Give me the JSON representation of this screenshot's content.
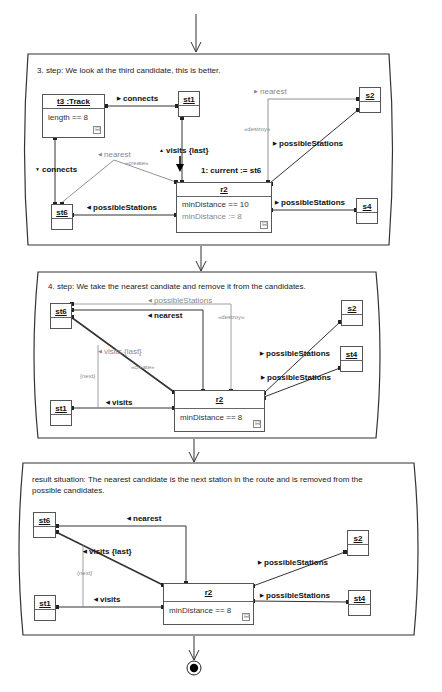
{
  "panels": [
    {
      "caption": "3. step: We look at the third candidate, this is better.",
      "objects": {
        "track": {
          "name": "t3 :Track",
          "attr": "length == 8"
        },
        "st1": "st1",
        "s2": "s2",
        "st6": "st6",
        "s4": "s4",
        "r2": {
          "name": "r2",
          "attr1": "minDistance  == 10",
          "attr2": "minDistance  := 8"
        }
      },
      "links": {
        "connects_top": "connects",
        "connects_left": "connects",
        "nearest_top": "nearest",
        "destroy": "«destroy»",
        "nearest_create": "nearest",
        "create": "«create»",
        "visits_last": "visits {last}",
        "current": "1: current := st6",
        "possible_s2": "possibleStations",
        "possible_s4": "possibleStations",
        "possible_st6": "possibleStations"
      }
    },
    {
      "caption": "4. step: We take the nearest candiate and remove it from the candidates.",
      "objects": {
        "st6": "st6",
        "st1": "st1",
        "s2": "s2",
        "st4": "st4",
        "r2": {
          "name": "r2",
          "attr1": "minDistance  == 8"
        }
      },
      "links": {
        "possible_st6": "possibleStations",
        "destroy": "«destroy»",
        "nearest": "nearest",
        "visits_last": "visits {last}",
        "create": "«create»",
        "next": "{next}",
        "visits": "visits",
        "possible_s2": "possibleStations",
        "possible_st4": "possibleStations"
      }
    },
    {
      "caption_line1": "result situation: The nearest candidate is the next station in the route and is removed from the",
      "caption_line2": "possible candidates.",
      "objects": {
        "st6": "st6",
        "st1": "st1",
        "s2": "s2",
        "st4": "st4",
        "r2": {
          "name": "r2",
          "attr1": "minDistance  == 8"
        }
      },
      "links": {
        "nearest": "nearest",
        "visits_last": "visits {last}",
        "next": "{next}",
        "visits": "visits",
        "possible_s2": "possibleStations",
        "possible_st4": "possibleStations"
      }
    }
  ],
  "icons": {
    "collapse": "⊟",
    "tri_right": "▶",
    "tri_left": "◀",
    "tri_up": "▲",
    "tri_down": "▼"
  },
  "colors": {
    "line": "#444444",
    "grey_line": "#999999",
    "text": "#111111",
    "muted": "#888888"
  }
}
